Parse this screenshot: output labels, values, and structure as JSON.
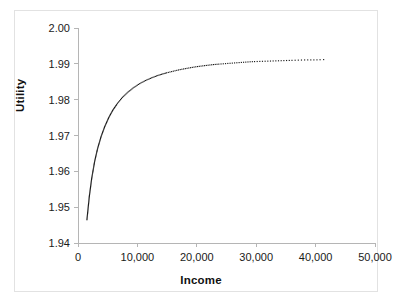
{
  "chart_data": {
    "type": "line",
    "title": "",
    "subtitle": "",
    "xlabel": "Income",
    "ylabel": "Utility",
    "xlim": [
      0,
      50000
    ],
    "ylim": [
      1.94,
      2.0
    ],
    "x_ticks": [
      0,
      10000,
      20000,
      30000,
      40000,
      50000
    ],
    "x_tick_labels": [
      "0",
      "10,000",
      "20,000",
      "30,000",
      "40,000",
      "50,000"
    ],
    "y_ticks": [
      1.94,
      1.95,
      1.96,
      1.97,
      1.98,
      1.99,
      2.0
    ],
    "y_tick_labels": [
      "1.94",
      "1.95",
      "1.96",
      "1.97",
      "1.98",
      "1.99",
      "2.00"
    ],
    "grid": false,
    "legend": "none",
    "series": [
      {
        "name": "Utility",
        "style": "dotted-marker-line",
        "color": "#1a1a1a",
        "x": [
          1500,
          1900,
          2300,
          2800,
          3300,
          3900,
          4500,
          5200,
          5900,
          6700,
          7500,
          8400,
          9300,
          10300,
          11300,
          12400,
          13500,
          14700,
          15900,
          17200,
          18500,
          19900,
          21300,
          22800,
          24300,
          25900,
          27500,
          29200,
          30900,
          32700,
          34500,
          36400,
          38300,
          40000,
          41500
        ],
        "y": [
          1.9465,
          1.953,
          1.958,
          1.9628,
          1.9664,
          1.9698,
          1.9725,
          1.9751,
          1.9772,
          1.9791,
          1.9807,
          1.9821,
          1.9833,
          1.9844,
          1.9853,
          1.9861,
          1.9868,
          1.9874,
          1.9879,
          1.9884,
          1.9888,
          1.9892,
          1.9895,
          1.9898,
          1.99,
          1.9902,
          1.9904,
          1.9906,
          1.9907,
          1.9908,
          1.9909,
          1.991,
          1.9911,
          1.9911,
          1.9912
        ]
      }
    ],
    "axis_color": "#b5b5b5",
    "line_color": "#1a1a1a",
    "background": "#ffffff"
  }
}
